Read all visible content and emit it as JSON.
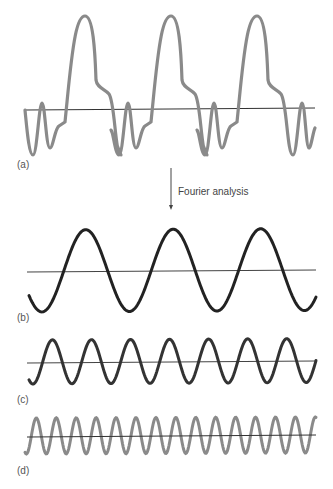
{
  "panels": [
    {
      "id": "a",
      "label": "(a)",
      "description": "complex periodic waveform",
      "color": "#8a8a8a"
    },
    {
      "id": "b",
      "label": "(b)",
      "description": "fundamental sine component (3 cycles)",
      "color": "#222222"
    },
    {
      "id": "c",
      "label": "(c)",
      "description": "sine component (7 cycles)",
      "color": "#333333"
    },
    {
      "id": "d",
      "label": "(d)",
      "description": "sine component (15 cycles)",
      "color": "#8a8a8a"
    }
  ],
  "arrow": {
    "caption": "Fourier analysis"
  },
  "colors": {
    "axis": "#333333",
    "text": "#555555"
  }
}
